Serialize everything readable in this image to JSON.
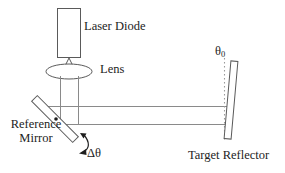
{
  "figure": {
    "kind": "optical-setup-diagram",
    "background_color": "#ffffff",
    "line_color": "#555555",
    "text_color": "#232323"
  },
  "labels": {
    "laser_diode": "Laser Diode",
    "lens": "Lens",
    "reference_mirror_line1": "Reference",
    "reference_mirror_line2": "Mirror",
    "delta_theta": "Δθ",
    "theta0_symbol": "θ",
    "theta0_subscript": "0",
    "target_reflector": "Target Reflector"
  },
  "components": [
    {
      "name": "laser-diode-body",
      "shape": "rectangle",
      "x": 57,
      "y": 8,
      "width": 24,
      "height": 50
    },
    {
      "name": "laser-diode-emitter",
      "shape": "triangle",
      "apex_x": 69,
      "apex_y": 58,
      "base_left_x": 62,
      "base_right_x": 76,
      "base_y": 71
    },
    {
      "name": "lens",
      "shape": "ellipse",
      "cx": 69,
      "cy": 71,
      "rx": 23,
      "ry": 7.5
    },
    {
      "name": "reference-mirror",
      "shape": "tilted-rectangle",
      "angle_deg": 45,
      "cx": 55,
      "cy": 119,
      "length": 58,
      "thickness": 8
    },
    {
      "name": "target-reflector",
      "shape": "tilted-rectangle",
      "angle_deg": 5,
      "cx": 232,
      "cy": 102,
      "length": 78,
      "thickness": 7
    },
    {
      "name": "normal-reference-line",
      "shape": "dotted-vertical-line",
      "x": 224,
      "y_top": 58,
      "y_bottom": 142
    }
  ],
  "beam": {
    "name": "laser-beam-path",
    "vertical_left_x": 60,
    "vertical_right_x": 78,
    "vertical_top_y": 74,
    "horizontal_upper_y": 106,
    "horizontal_lower_y": 124,
    "horizontal_end_x": 228
  },
  "annotations": {
    "rotation_arrow": {
      "name": "delta-theta-rotation-arrow",
      "description": "curved double-headed arc below reference mirror"
    }
  }
}
